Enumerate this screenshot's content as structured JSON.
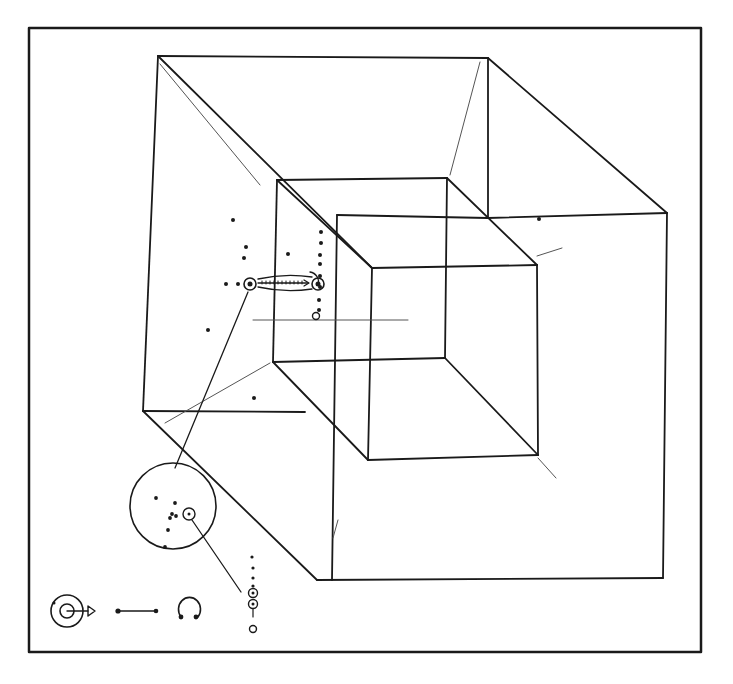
{
  "diagram": {
    "style": "hand-drawn sketch, scanned, monochrome",
    "colors": {
      "ink": "#1a1a1a",
      "faint_ink": "#555555",
      "paper": "#ffffff"
    },
    "frame": {
      "x": 29,
      "y": 28,
      "width": 672,
      "height": 624
    },
    "outer_cube": {
      "edges": [
        [
          [
            158,
            56
          ],
          [
            488,
            58
          ]
        ],
        [
          [
            488,
            58
          ],
          [
            667,
            213
          ]
        ],
        [
          [
            667,
            213
          ],
          [
            663,
            578
          ]
        ],
        [
          [
            663,
            578
          ],
          [
            317,
            580
          ]
        ],
        [
          [
            317,
            580
          ],
          [
            143,
            411
          ]
        ],
        [
          [
            143,
            411
          ],
          [
            158,
            56
          ]
        ],
        [
          [
            158,
            56
          ],
          [
            372,
            268
          ]
        ],
        [
          [
            488,
            58
          ],
          [
            488,
            218
          ]
        ],
        [
          [
            143,
            411
          ],
          [
            305,
            412
          ]
        ]
      ]
    },
    "middle_box": {
      "edges": [
        [
          [
            277,
            180
          ],
          [
            447,
            178
          ]
        ],
        [
          [
            447,
            178
          ],
          [
            537,
            265
          ]
        ],
        [
          [
            277,
            180
          ],
          [
            273,
            362
          ]
        ],
        [
          [
            273,
            362
          ],
          [
            368,
            460
          ]
        ],
        [
          [
            447,
            178
          ],
          [
            445,
            358
          ]
        ],
        [
          [
            445,
            358
          ],
          [
            273,
            362
          ]
        ],
        [
          [
            337,
            215
          ],
          [
            332,
            580
          ]
        ],
        [
          [
            337,
            215
          ],
          [
            488,
            218
          ]
        ],
        [
          [
            488,
            218
          ],
          [
            667,
            213
          ]
        ]
      ]
    },
    "inner_cube": {
      "edges": [
        [
          [
            372,
            268
          ],
          [
            537,
            265
          ]
        ],
        [
          [
            537,
            265
          ],
          [
            538,
            455
          ]
        ],
        [
          [
            538,
            455
          ],
          [
            368,
            460
          ]
        ],
        [
          [
            368,
            460
          ],
          [
            372,
            268
          ]
        ],
        [
          [
            277,
            180
          ],
          [
            372,
            268
          ]
        ],
        [
          [
            445,
            358
          ],
          [
            538,
            455
          ]
        ]
      ]
    },
    "faint_lines": [
      [
        [
          160,
          64
        ],
        [
          260,
          185
        ]
      ],
      [
        [
          165,
          423
        ],
        [
          270,
          363
        ]
      ],
      [
        [
          537,
          256
        ],
        [
          562,
          248
        ]
      ],
      [
        [
          480,
          62
        ],
        [
          450,
          175
        ]
      ],
      [
        [
          538,
          458
        ],
        [
          556,
          478
        ]
      ],
      [
        [
          333,
          538
        ],
        [
          338,
          520
        ]
      ],
      [
        [
          253,
          320
        ],
        [
          408,
          320
        ]
      ]
    ],
    "dots": [
      [
        233,
        220
      ],
      [
        288,
        254
      ],
      [
        246,
        247
      ],
      [
        244,
        258
      ],
      [
        226,
        284
      ],
      [
        238,
        284
      ],
      [
        208,
        330
      ],
      [
        254,
        398
      ],
      [
        321,
        232
      ],
      [
        321,
        243
      ],
      [
        320,
        255
      ],
      [
        320,
        264
      ],
      [
        320,
        276
      ],
      [
        320,
        287
      ],
      [
        319,
        300
      ],
      [
        319,
        310
      ],
      [
        539,
        219
      ]
    ],
    "ringed_nodes": [
      {
        "cx": 250,
        "cy": 284,
        "r": 6,
        "inner_r": 2.5
      },
      {
        "cx": 318,
        "cy": 284,
        "r": 6,
        "inner_r": 2.5
      }
    ],
    "open_node": {
      "cx": 316,
      "cy": 316,
      "r": 3.5
    },
    "arrow_bundle": {
      "from": [
        258,
        283
      ],
      "to": [
        312,
        283
      ]
    },
    "leader_line_1": [
      [
        248,
        292
      ],
      [
        175,
        468
      ]
    ],
    "inset_circle": {
      "cx": 173,
      "cy": 506,
      "r": 43,
      "dots": [
        [
          156,
          498
        ],
        [
          175,
          503
        ],
        [
          172,
          514
        ],
        [
          170,
          518
        ],
        [
          176,
          516
        ],
        [
          168,
          530
        ],
        [
          165,
          547
        ]
      ],
      "ring": {
        "cx": 189,
        "cy": 514,
        "r": 6
      }
    },
    "leader_line_2": [
      [
        192,
        520
      ],
      [
        241,
        592
      ]
    ],
    "vertical_chain": {
      "dots": [
        [
          252,
          557
        ],
        [
          253,
          568
        ],
        [
          253,
          578
        ],
        [
          253,
          586
        ]
      ],
      "rings": [
        [
          253,
          593
        ],
        [
          253,
          604
        ]
      ],
      "open_end": [
        253,
        629
      ]
    },
    "legend": [
      {
        "symbol": "target-with-arrow",
        "x": 67,
        "y": 604
      },
      {
        "symbol": "dumbbell-link",
        "x": 118,
        "y": 611
      },
      {
        "symbol": "open-loop",
        "x": 192,
        "y": 604
      }
    ]
  }
}
